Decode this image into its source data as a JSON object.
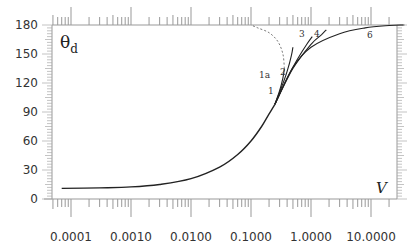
{
  "chart_data": {
    "type": "line",
    "title": "",
    "xlabel": "V",
    "ylabel": "θd",
    "xscale": "log",
    "xlim": [
      5e-05,
      40
    ],
    "ylim": [
      0,
      180
    ],
    "x_tick_labels": [
      "0.0001",
      "0.0010",
      "0.0100",
      "0.1000",
      "1.0000",
      "10.0000"
    ],
    "y_tick_labels": [
      "0",
      "30",
      "60",
      "90",
      "120",
      "150",
      "180"
    ],
    "grid": false,
    "legend": null,
    "series": [
      {
        "name": "main",
        "style": "solid",
        "x": [
          7e-05,
          0.0003,
          0.001,
          0.003,
          0.01,
          0.03,
          0.06,
          0.1,
          0.15,
          0.2,
          0.25
        ],
        "y": [
          11,
          11.5,
          12.5,
          15,
          21,
          33,
          46,
          60,
          75,
          88,
          98
        ]
      },
      {
        "name": "1",
        "style": "solid",
        "x": [
          0.25,
          0.3,
          0.34,
          0.36
        ],
        "y": [
          98,
          112,
          125,
          135
        ]
      },
      {
        "name": "1a",
        "style": "dashed",
        "x": [
          0.36,
          0.34,
          0.28,
          0.2,
          0.13,
          0.1
        ],
        "y": [
          135,
          150,
          163,
          172,
          177,
          180
        ]
      },
      {
        "name": "2",
        "style": "solid",
        "x": [
          0.25,
          0.32,
          0.4,
          0.47,
          0.5
        ],
        "y": [
          98,
          115,
          132,
          148,
          157
        ]
      },
      {
        "name": "3",
        "style": "solid",
        "x": [
          0.25,
          0.4,
          0.6,
          0.85,
          1.05
        ],
        "y": [
          98,
          125,
          145,
          160,
          168
        ]
      },
      {
        "name": "4",
        "style": "solid",
        "x": [
          0.25,
          0.5,
          1.0,
          1.5,
          1.8
        ],
        "y": [
          98,
          135,
          160,
          170,
          175
        ]
      },
      {
        "name": "6",
        "style": "solid",
        "x": [
          0.25,
          0.5,
          1.0,
          3,
          8,
          20,
          35
        ],
        "y": [
          98,
          136,
          157,
          171,
          177,
          179.5,
          180
        ]
      }
    ],
    "annotations": [
      "1a",
      "1",
      "2",
      "3",
      "4",
      "6"
    ]
  },
  "labels": {
    "y_axis_title": "θ",
    "y_axis_sub": "d",
    "x_axis_title": "V",
    "branch_1a": "1a",
    "branch_1": "1",
    "branch_2": "2",
    "branch_3": "3",
    "branch_4": "4",
    "branch_6": "6"
  }
}
